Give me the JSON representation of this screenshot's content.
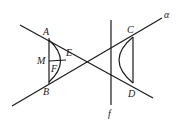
{
  "diagram": {
    "type": "geometry-hyperbola",
    "labels": {
      "A": "A",
      "B": "B",
      "C": "C",
      "D": "D",
      "E": "E",
      "F": "F",
      "M": "M",
      "f": "f",
      "alpha": "α"
    },
    "points": {
      "A": [
        49,
        38
      ],
      "B": [
        49,
        84
      ],
      "C": [
        133,
        37
      ],
      "D": [
        133,
        83
      ],
      "E": [
        63,
        62
      ]
    },
    "lines": [
      {
        "name": "line-through-A-D",
        "from": [
          20,
          25
        ],
        "to": [
          153,
          98
        ]
      },
      {
        "name": "line-through-B-C-alpha",
        "from": [
          12,
          106
        ],
        "to": [
          162,
          18
        ]
      },
      {
        "name": "vertical-f",
        "from": [
          111,
          20
        ],
        "to": [
          111,
          105
        ]
      },
      {
        "name": "segment-AB",
        "from": [
          49,
          38
        ],
        "to": [
          49,
          84
        ]
      },
      {
        "name": "segment-CD",
        "from": [
          133,
          37
        ],
        "to": [
          133,
          83
        ]
      }
    ]
  }
}
